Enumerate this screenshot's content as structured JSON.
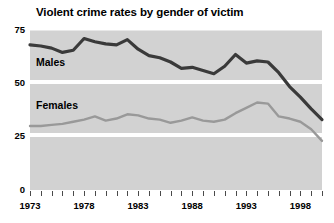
{
  "chart_data": {
    "type": "line",
    "title": "Violent crime rates by gender of victim",
    "xlabel": "",
    "ylabel": "",
    "xlim": [
      1973,
      2000
    ],
    "ylim": [
      0,
      75
    ],
    "grid": "horizontal-white-bands",
    "legend_position": "in-plot-inline",
    "plot_background_color": "#d2d2d2",
    "y_ticks": [
      "0",
      "25",
      "50",
      "75"
    ],
    "y_tick_values": [
      0,
      25,
      50,
      75
    ],
    "x_ticks": [
      "1973",
      "1978",
      "1983",
      "1988",
      "1993",
      "1998"
    ],
    "x_tick_values": [
      1973,
      1978,
      1983,
      1988,
      1993,
      1998
    ],
    "x": [
      1973,
      1974,
      1975,
      1976,
      1977,
      1978,
      1979,
      1980,
      1981,
      1982,
      1983,
      1984,
      1985,
      1986,
      1987,
      1988,
      1989,
      1990,
      1991,
      1992,
      1993,
      1994,
      1995,
      1996,
      1997,
      1998,
      1999,
      2000
    ],
    "series": [
      {
        "name": "Males",
        "color": "#3a3a3a",
        "line_width": 3.2,
        "values": [
          68,
          67.5,
          66.5,
          64.5,
          65.5,
          71,
          69.5,
          68.5,
          68,
          70.5,
          66,
          63,
          62,
          60,
          57,
          57.5,
          56,
          54.5,
          58,
          63.5,
          59.5,
          60.5,
          60,
          55,
          48.5,
          43.5,
          38,
          33
        ]
      },
      {
        "name": "Females",
        "color": "#999999",
        "line_width": 2.4,
        "values": [
          30,
          30,
          30.5,
          31,
          32,
          33,
          34.5,
          32.5,
          33.5,
          35.5,
          35,
          33.5,
          33,
          31.5,
          32.5,
          34,
          32.5,
          32,
          33,
          36,
          38.5,
          41,
          40.5,
          34.5,
          33.5,
          32,
          28.5,
          23
        ]
      }
    ],
    "annotations": [
      {
        "text": "Males",
        "x_value": 1974.5,
        "y_value": 58
      },
      {
        "text": "Females",
        "x_value": 1974.5,
        "y_value": 37
      }
    ]
  },
  "labels": {
    "title": "Violent crime rates by gender of victim",
    "males": "Males",
    "females": "Females",
    "y_75": "75",
    "y_50": "50",
    "y_25": "25",
    "y_0": "0",
    "x_1973": "1973",
    "x_1978": "1978",
    "x_1983": "1983",
    "x_1988": "1988",
    "x_1993": "1993",
    "x_1998": "1998"
  }
}
